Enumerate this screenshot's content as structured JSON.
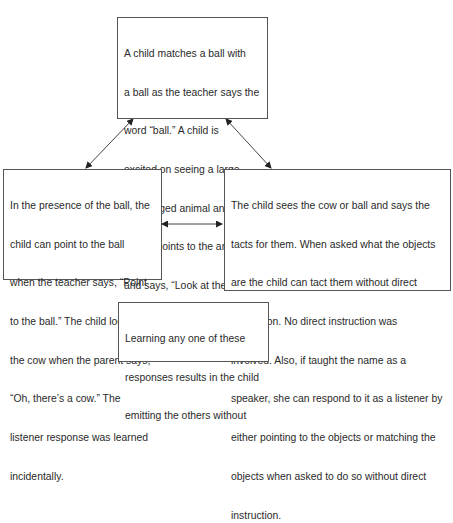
{
  "diagram": {
    "boxes": {
      "top": {
        "lines": [
          "A child matches a ball with",
          "a ball as the teacher says the",
          "word “ball.” A child is",
          "excited on seeing a large",
          "four-legged animal and the",
          "parent points to the animal",
          "and says, “Look at the cow.”"
        ]
      },
      "left": {
        "lines": [
          "In the presence of the ball, the",
          "child can point to the ball",
          "when the teacher says, “Point",
          "to the ball.” The child looks at",
          "the cow when the parent says,",
          "“Oh, there’s a cow.” The",
          "listener response was learned",
          "incidentally."
        ]
      },
      "right": {
        "lines": [
          "The child sees the cow or ball and says the",
          "tacts for them. When asked what the objects",
          "are the child can tact them without direct",
          "instruction. No direct instruction was",
          "involved. Also, if taught the name as a",
          "speaker, she can respond to it as a listener by",
          "either pointing to the objects or matching the",
          "objects when asked to do so without direct",
          "instruction."
        ]
      },
      "bottom": {
        "lines": [
          "Learning any one of these",
          "responses results in the child",
          "emitting the others without"
        ]
      }
    },
    "arrows": [
      {
        "from": "top",
        "to": "left",
        "type": "bidirectional"
      },
      {
        "from": "top",
        "to": "right",
        "type": "bidirectional"
      },
      {
        "from": "left",
        "to": "right",
        "type": "bidirectional"
      }
    ],
    "colors": {
      "border": "#555555",
      "arrow": "#333333",
      "text": "#2a2a2a"
    }
  }
}
